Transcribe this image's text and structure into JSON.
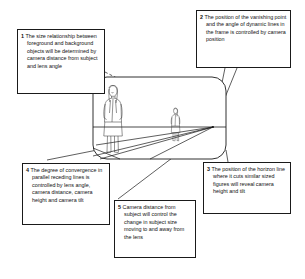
{
  "diagram": {
    "line_color": "#1a1a1a",
    "background_color": "#ffffff"
  },
  "callouts": [
    {
      "id": "1",
      "number": "1",
      "text": "The size relationship between foreground and background objects will be determined by camera distance from subject and lens angle",
      "full": "1 The size relationship between foreground and background objects will be determined by camera distance from subject and lens angle"
    },
    {
      "id": "2",
      "number": "2",
      "text": "The position of the vanishing point and the angle of dynamic lines in the frame is controlled by camera position",
      "full": "2 The position of the vanishing point and the angle of dynamic lines in the frame is controlled by camera position"
    },
    {
      "id": "3",
      "number": "3",
      "text": "The position of the horizon line where it cuts similar sized figures will reveal camera height and tilt",
      "full": "3 The position of the horizon line where it cuts similar sized figures will reveal camera height and tilt"
    },
    {
      "id": "4",
      "number": "4",
      "text": "The degree  of convergence in parallel receding lines is controlled by lens angle, camera distance, camera height and camera tilt",
      "full": "4 The degree  of convergence in parallel receding lines is controlled by lens angle, camera distance, camera height and camera tilt"
    },
    {
      "id": "5",
      "number": "5",
      "text": "Camera distance from subject will control the change in subject size moving to and away from the lens",
      "full": "5 Camera distance from subject will control the change in subject size moving to and away from the lens"
    }
  ],
  "scene": {
    "frame_label": "camera-frame",
    "horizon_label": "horizon-line",
    "vanishing_point_label": "vanishing-point",
    "foreground_figure_label": "foreground-figure",
    "background_figure_label": "background-figure"
  }
}
